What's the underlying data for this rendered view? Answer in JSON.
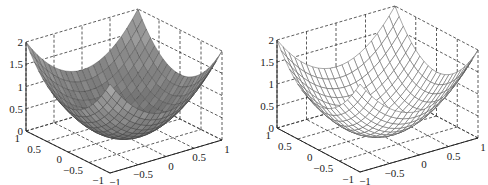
{
  "chart_data": [
    {
      "type": "surface",
      "style": "surf (shaded faces)",
      "function": "z = x^2 + y^2",
      "grid": true,
      "grid_points": 21,
      "x_range": [
        -1,
        1
      ],
      "y_range": [
        -1,
        1
      ],
      "zlim": [
        0,
        2
      ],
      "xticks": [
        "-1",
        "-0.5",
        "0",
        "0.5",
        "1"
      ],
      "yticks": [
        "1",
        "0.5",
        "0",
        "-0.5",
        "-1"
      ],
      "zticks": [
        "0",
        "0.5",
        "1",
        "1.5",
        "2"
      ],
      "face_color": "#8a8a8a",
      "edge_color": "#3a3a3a"
    },
    {
      "type": "surface",
      "style": "mesh (wireframe)",
      "function": "z = x^2 + y^2",
      "grid": true,
      "grid_points": 21,
      "x_range": [
        -1,
        1
      ],
      "y_range": [
        -1,
        1
      ],
      "zlim": [
        0,
        2
      ],
      "xticks": [
        "-1",
        "-0.5",
        "0",
        "0.5",
        "1"
      ],
      "yticks": [
        "1",
        "0.5",
        "0",
        "-0.5",
        "-1"
      ],
      "zticks": [
        "0",
        "0.5",
        "1",
        "1.5",
        "2"
      ],
      "face_color": "#ffffff",
      "edge_color": "#555555"
    }
  ]
}
